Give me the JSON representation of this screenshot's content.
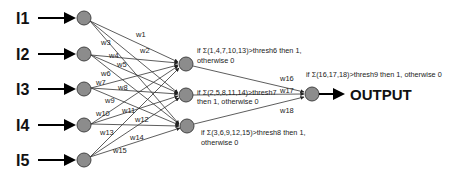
{
  "diagram": {
    "type": "neural-network",
    "inputs": [
      {
        "label": "I1",
        "y": 18
      },
      {
        "label": "I2",
        "y": 54
      },
      {
        "label": "I3",
        "y": 89
      },
      {
        "label": "I4",
        "y": 125
      },
      {
        "label": "I5",
        "y": 160
      }
    ],
    "hidden": [
      {
        "y": 64,
        "rule_line1": "if Σ(1,4,7,10,13)>thresh6 then 1,",
        "rule_line2": "otherwise 0"
      },
      {
        "y": 95,
        "rule_line1": "if Σ(2,5,8,11,14)>thresh7",
        "rule_line2": "then 1, otherwise 0"
      },
      {
        "y": 126,
        "rule_line1": "if Σ(3,6,9,12,15)>thresh8 then 1,",
        "rule_line2": "otherwise 0"
      }
    ],
    "output_node": {
      "rule": "if Σ(16,17,18)>thresh9 then 1, otherwise 0",
      "label": "OUTPUT"
    },
    "weights": {
      "w1": "w1",
      "w2": "w2",
      "w3": "w3",
      "w4": "w4",
      "w5": "w5",
      "w6": "w6",
      "w7": "w7",
      "w8": "w8",
      "w9": "w9",
      "w10": "w10",
      "w11": "w11",
      "w12": "w12",
      "w13": "w13",
      "w14": "w14",
      "w15": "w15",
      "w16": "w16",
      "w17": "w17",
      "w18": "w18"
    },
    "colors": {
      "node_fill": "#8c8c8c",
      "node_stroke": "#444444",
      "edge": "#333333"
    }
  }
}
